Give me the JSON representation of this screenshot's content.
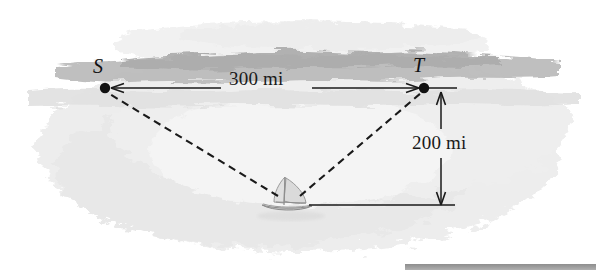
{
  "figure": {
    "type": "geometry-diagram",
    "background_color": "#ffffff",
    "water_wash_color": "#ececec",
    "sky_wash_color": "#f0f0f0",
    "horizon_band_color": "#b9b9b9",
    "line_color": "#1a1a1a",
    "rule_color": "#9a9a9a"
  },
  "points": [
    {
      "id": "S",
      "label": "S",
      "x": 105,
      "y": 88,
      "label_x": 93,
      "label_y": 55
    },
    {
      "id": "T",
      "label": "T",
      "x": 424,
      "y": 88,
      "label_x": 413,
      "label_y": 54
    },
    {
      "id": "B",
      "label": "",
      "x": 290,
      "y": 205,
      "label_x": 0,
      "label_y": 0
    }
  ],
  "dimensions": [
    {
      "name": "horizontal-distance",
      "value": "300 mi",
      "orientation": "horizontal",
      "from": "S",
      "to": "T",
      "arrow_y": 88,
      "x_start": 111,
      "x_end": 419
    },
    {
      "name": "vertical-distance",
      "value": "200 mi",
      "orientation": "vertical",
      "arrow_x": 441,
      "y_start": 92,
      "y_end": 205
    }
  ],
  "sight_lines": [
    {
      "name": "boat-to-S",
      "style": "dashed",
      "from": "boat",
      "to": "S"
    },
    {
      "name": "boat-to-T",
      "style": "dashed",
      "from": "boat",
      "to": "T"
    }
  ],
  "guide_lines": [
    {
      "name": "baseline-from-boat",
      "style": "solid",
      "x1": 310,
      "y1": 205,
      "x2": 452,
      "y2": 205
    },
    {
      "name": "tick-at-T",
      "style": "solid",
      "x1": 428,
      "y1": 88,
      "x2": 456,
      "y2": 88
    }
  ],
  "boat": {
    "name": "sailboat",
    "x": 290,
    "y": 198,
    "hull_color": "#cfcfcf",
    "sail_color": "#d8d8d8"
  },
  "footer_rule": {
    "name": "bottom-rule",
    "visible": true
  }
}
